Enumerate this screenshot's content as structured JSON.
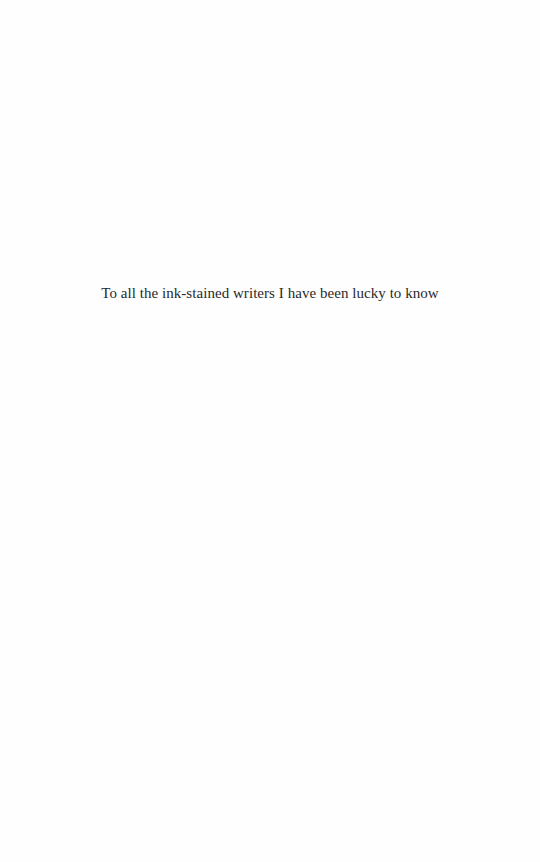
{
  "page": {
    "background_color": "#fefefe",
    "text_color": "#2a2a2a",
    "dedication": "To all the ink-stained writers I have been lucky to know"
  }
}
